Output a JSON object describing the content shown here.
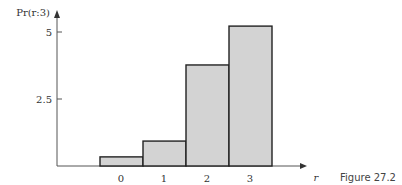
{
  "chart_data": {
    "type": "bar",
    "title": "",
    "ylabel": "Pr(r:3)",
    "xlabel": "r",
    "categories": [
      "0",
      "1",
      "2",
      "3"
    ],
    "values": [
      0.34,
      0.93,
      3.77,
      5.22
    ],
    "yticks": [
      "2.5",
      "5"
    ],
    "ylim": [
      0,
      5.5
    ],
    "grid": false,
    "legend": null,
    "bar_color": "#d3d3d3",
    "edge_color": "#222222"
  },
  "caption": "Figure 27.2"
}
